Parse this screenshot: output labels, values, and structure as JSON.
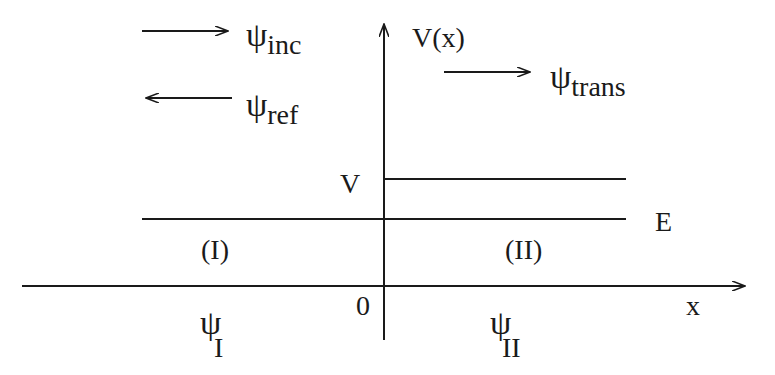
{
  "diagram": {
    "type": "potential-step",
    "y_axis_label": "V(x)",
    "x_axis_label": "x",
    "origin_label": "0",
    "potential_label": "V",
    "energy_label": "E",
    "region_labels": [
      "(I)",
      "(II)"
    ],
    "waves": {
      "incident": {
        "symbol": "ψ",
        "subscript": "inc",
        "direction": "right"
      },
      "reflected": {
        "symbol": "ψ",
        "subscript": "ref",
        "direction": "left"
      },
      "transmitted": {
        "symbol": "ψ",
        "subscript": "trans",
        "direction": "right"
      }
    },
    "region_wavefunctions": [
      {
        "symbol": "ψ",
        "subscript": "I"
      },
      {
        "symbol": "ψ",
        "subscript": "II"
      }
    ],
    "colors": {
      "line": "#1a1a1a",
      "background": "#ffffff"
    }
  }
}
